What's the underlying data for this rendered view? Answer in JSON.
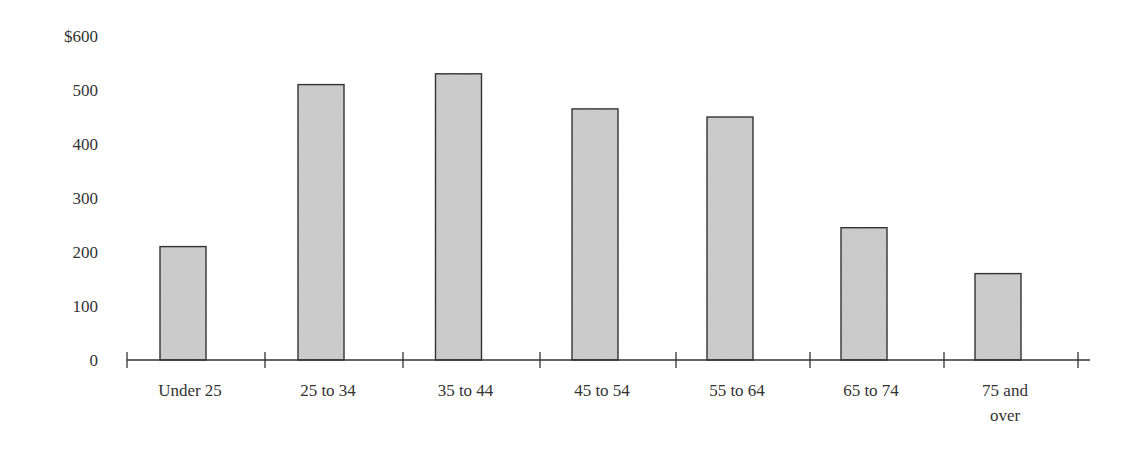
{
  "chart_data": {
    "type": "bar",
    "title": "",
    "xlabel": "",
    "ylabel": "",
    "categories": [
      "Under 25",
      "25 to 34",
      "35 to 44",
      "45 to 54",
      "55 to 64",
      "65 to 74",
      "75 and over"
    ],
    "category_label_lines": [
      [
        "Under 25"
      ],
      [
        "25 to 34"
      ],
      [
        "35 to 44"
      ],
      [
        "45 to 54"
      ],
      [
        "55 to 64"
      ],
      [
        "65 to 74"
      ],
      [
        "75 and",
        "over"
      ]
    ],
    "values": [
      210,
      510,
      530,
      465,
      450,
      245,
      160
    ],
    "ylim": [
      0,
      600
    ],
    "yticks": [
      0,
      100,
      200,
      300,
      400,
      500,
      600
    ],
    "ytick_labels": [
      "0",
      "100",
      "200",
      "300",
      "400",
      "500",
      "$600"
    ],
    "grid": false,
    "legend": null,
    "bar_fill": "#cfcfcf",
    "bar_stroke": "#333333",
    "axis_color": "#333333"
  }
}
